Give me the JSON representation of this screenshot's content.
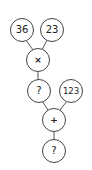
{
  "diagram": {
    "type": "calculation-tree",
    "nodes": [
      {
        "id": "n36",
        "label": "36",
        "role": "operand"
      },
      {
        "id": "n23",
        "label": "23",
        "role": "operand"
      },
      {
        "id": "mul",
        "label": "×",
        "role": "operator"
      },
      {
        "id": "q1",
        "label": "?",
        "role": "result-unknown"
      },
      {
        "id": "n123",
        "label": "123",
        "role": "operand"
      },
      {
        "id": "add",
        "label": "+",
        "role": "operator"
      },
      {
        "id": "q2",
        "label": "?",
        "role": "result-unknown"
      }
    ],
    "edges": [
      [
        "n36",
        "mul"
      ],
      [
        "n23",
        "mul"
      ],
      [
        "mul",
        "q1"
      ],
      [
        "q1",
        "add"
      ],
      [
        "n123",
        "add"
      ],
      [
        "add",
        "q2"
      ]
    ]
  }
}
